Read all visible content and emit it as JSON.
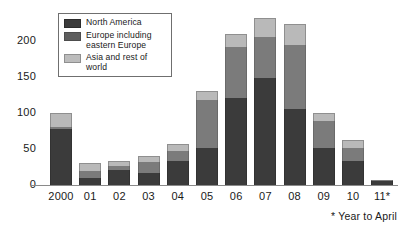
{
  "chart_data": {
    "type": "bar",
    "subtype": "stacked",
    "title": "",
    "xlabel": "",
    "ylabel": "",
    "ylim": [
      0,
      240
    ],
    "yticks": [
      0,
      50,
      100,
      150,
      200
    ],
    "grid": false,
    "legend_position": "top-left",
    "categories": [
      "2000",
      "01",
      "02",
      "03",
      "04",
      "05",
      "06",
      "07",
      "08",
      "09",
      "10",
      "11*"
    ],
    "series": [
      {
        "name": "North America",
        "color": "#3b3b3b",
        "values": [
          78,
          10,
          21,
          17,
          33,
          51,
          121,
          148,
          105,
          51,
          33,
          5
        ]
      },
      {
        "name": "Europe including eastern Europe",
        "color": "#7b7b7b",
        "values": [
          2,
          10,
          5,
          15,
          14,
          67,
          71,
          58,
          90,
          38,
          18,
          2
        ]
      },
      {
        "name": "Asia and rest of world",
        "color": "#b9b9b9",
        "values": [
          20,
          11,
          8,
          8,
          10,
          12,
          18,
          26,
          29,
          11,
          11,
          0
        ]
      }
    ],
    "totals": [
      100,
      31,
      34,
      40,
      57,
      130,
      210,
      232,
      224,
      100,
      62,
      7
    ],
    "annotations": [
      "* Year to April"
    ]
  },
  "axes": {
    "y_ticks": [
      "200",
      "150",
      "100",
      "50",
      "0"
    ],
    "x_ticks": [
      "2000",
      "01",
      "02",
      "03",
      "04",
      "05",
      "06",
      "07",
      "08",
      "09",
      "10",
      "11*"
    ]
  },
  "legend": {
    "items": [
      {
        "label": "North America",
        "swatch": "swatch-dark"
      },
      {
        "label": "Europe including eastern Europe",
        "swatch": "swatch-medium"
      },
      {
        "label": "Asia and rest of world",
        "swatch": "swatch-light"
      }
    ]
  },
  "footnote": {
    "text": "* Year to April"
  }
}
